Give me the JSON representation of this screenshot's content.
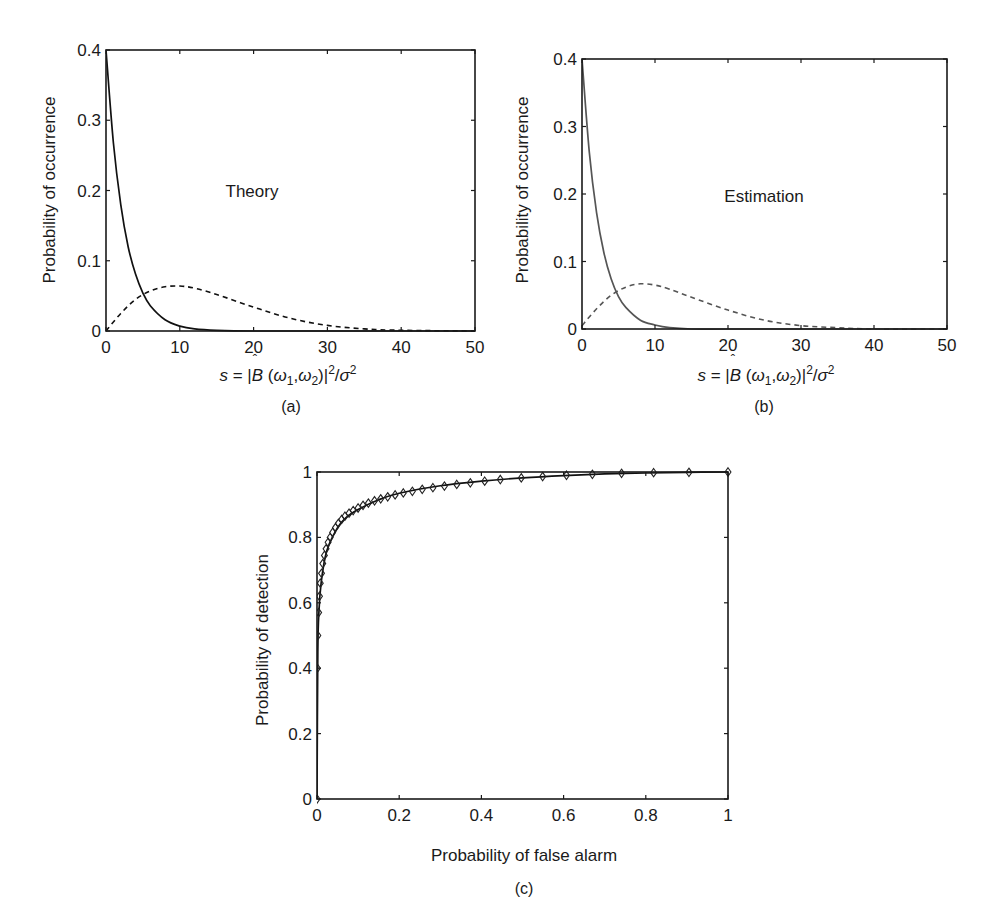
{
  "figure": {
    "panels": [
      "(a)",
      "(b)",
      "(c)"
    ]
  },
  "chart_data": [
    {
      "id": "a",
      "type": "line",
      "panel_label": "(a)",
      "annotation": "Theory",
      "xlabel": "s = |B̂ (ω1,ω2)|²/σ²",
      "ylabel": "Probability of occurrence",
      "xlim": [
        0,
        50
      ],
      "ylim": [
        0,
        0.4
      ],
      "xticks": [
        "0",
        "10",
        "20",
        "30",
        "40",
        "50"
      ],
      "yticks": [
        "0",
        "0.1",
        "0.2",
        "0.3",
        "0.4"
      ],
      "grid": false,
      "series": [
        {
          "name": "H0 (solid)",
          "style": "solid",
          "x": [
            0,
            1,
            2,
            3,
            4,
            5,
            6,
            8,
            10,
            12,
            15,
            20,
            30,
            50
          ],
          "y": [
            0.4,
            0.268,
            0.18,
            0.12,
            0.081,
            0.054,
            0.036,
            0.016,
            0.007,
            0.003,
            0.001,
            0.0,
            0.0,
            0.0
          ]
        },
        {
          "name": "H1 (dashed)",
          "style": "dashed",
          "x": [
            0,
            2,
            4,
            6,
            8,
            10,
            12,
            15,
            20,
            25,
            30,
            35,
            40,
            50
          ],
          "y": [
            0.0,
            0.025,
            0.045,
            0.057,
            0.063,
            0.064,
            0.061,
            0.052,
            0.034,
            0.018,
            0.008,
            0.003,
            0.001,
            0.0
          ]
        }
      ]
    },
    {
      "id": "b",
      "type": "line",
      "panel_label": "(b)",
      "annotation": "Estimation",
      "xlabel": "s = |B̂ (ω1,ω2)|²/σ²",
      "ylabel": "Probability of occurrence",
      "xlim": [
        0,
        50
      ],
      "ylim": [
        0,
        0.4
      ],
      "xticks": [
        "0",
        "10",
        "20",
        "30",
        "40",
        "50"
      ],
      "yticks": [
        "0",
        "0.1",
        "0.2",
        "0.3",
        "0.4"
      ],
      "grid": false,
      "series": [
        {
          "name": "H0 (solid)",
          "style": "solid",
          "x": [
            0,
            1,
            2,
            3,
            4,
            5,
            6,
            8,
            10,
            12,
            15,
            20,
            30,
            50
          ],
          "y": [
            0.4,
            0.262,
            0.172,
            0.113,
            0.074,
            0.048,
            0.032,
            0.013,
            0.006,
            0.002,
            0.0,
            0.0,
            0.0,
            0.0
          ]
        },
        {
          "name": "H1 (dashed)",
          "style": "dashed",
          "x": [
            0,
            2,
            4,
            6,
            8,
            10,
            12,
            15,
            20,
            25,
            30,
            35,
            40,
            50
          ],
          "y": [
            0.005,
            0.03,
            0.05,
            0.062,
            0.067,
            0.065,
            0.059,
            0.047,
            0.028,
            0.013,
            0.005,
            0.002,
            0.0,
            0.0
          ]
        }
      ]
    },
    {
      "id": "c",
      "type": "line",
      "panel_label": "(c)",
      "annotation": "",
      "xlabel": "Probability of false alarm",
      "ylabel": "Probability of detection",
      "xlim": [
        0,
        1
      ],
      "ylim": [
        0,
        1
      ],
      "xticks": [
        "0",
        "0.2",
        "0.4",
        "0.6",
        "0.8",
        "1"
      ],
      "yticks": [
        "0",
        "0.2",
        "0.4",
        "0.6",
        "0.8",
        "1"
      ],
      "grid": false,
      "series": [
        {
          "name": "Theory (solid line)",
          "style": "solid",
          "x": [
            0,
            0.002,
            0.005,
            0.01,
            0.02,
            0.03,
            0.05,
            0.07,
            0.1,
            0.15,
            0.2,
            0.3,
            0.4,
            0.5,
            0.6,
            0.7,
            0.8,
            0.9,
            1.0
          ],
          "y": [
            0,
            0.45,
            0.58,
            0.66,
            0.74,
            0.78,
            0.83,
            0.86,
            0.885,
            0.915,
            0.935,
            0.958,
            0.972,
            0.982,
            0.989,
            0.994,
            0.997,
            0.999,
            1.0
          ]
        },
        {
          "name": "Estimation (diamond markers)",
          "style": "markers",
          "marker": "diamond",
          "x": [
            0.0,
            0.001,
            0.002,
            0.004,
            0.006,
            0.008,
            0.011,
            0.014,
            0.018,
            0.022,
            0.027,
            0.032,
            0.038,
            0.045,
            0.052,
            0.06,
            0.068,
            0.078,
            0.088,
            0.1,
            0.112,
            0.125,
            0.14,
            0.155,
            0.172,
            0.19,
            0.21,
            0.232,
            0.256,
            0.282,
            0.31,
            0.34,
            0.373,
            0.408,
            0.446,
            0.497,
            0.549,
            0.607,
            0.67,
            0.741,
            0.819,
            0.905,
            1.0
          ],
          "y": [
            0.0,
            0.4,
            0.5,
            0.57,
            0.62,
            0.66,
            0.69,
            0.72,
            0.745,
            0.765,
            0.785,
            0.8,
            0.815,
            0.83,
            0.843,
            0.855,
            0.865,
            0.874,
            0.882,
            0.89,
            0.898,
            0.905,
            0.912,
            0.918,
            0.924,
            0.93,
            0.936,
            0.941,
            0.947,
            0.952,
            0.957,
            0.962,
            0.967,
            0.972,
            0.977,
            0.982,
            0.986,
            0.99,
            0.993,
            0.996,
            0.998,
            0.999,
            1.0
          ]
        }
      ]
    }
  ]
}
